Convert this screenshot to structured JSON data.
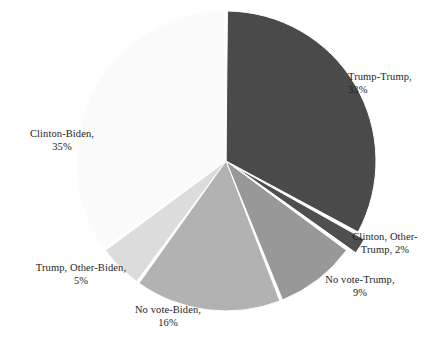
{
  "chart_data": {
    "type": "pie",
    "title": "",
    "subtitle": "",
    "legend_position": "labels-outside",
    "grid": false,
    "start_angle_deg": 0,
    "direction": "clockwise",
    "units": "percent",
    "categories": [
      "Trump-Trump",
      "Clinton, Other-Trump",
      "No vote-Trump",
      "No vote-Biden",
      "Trump, Other-Biden",
      "Clinton-Biden"
    ],
    "values": [
      33,
      2,
      9,
      16,
      5,
      35
    ],
    "slices": [
      {
        "name": "Trump-Trump",
        "label_line1": "Trump-Trump,",
        "label_line2": "33%",
        "value": 33,
        "value_text": "33%",
        "color": "#4a4a4a",
        "exploded": false
      },
      {
        "name": "Clinton, Other-Trump",
        "label_line1": "Clinton, Other-",
        "label_line2": "Trump, 2%",
        "value": 2,
        "value_text": "2%",
        "color": "#4f4f4f",
        "exploded": true
      },
      {
        "name": "No vote-Trump",
        "label_line1": "No vote-Trump,",
        "label_line2": "9%",
        "value": 9,
        "value_text": "9%",
        "color": "#989898",
        "exploded": false
      },
      {
        "name": "No vote-Biden",
        "label_line1": "No vote-Biden,",
        "label_line2": "16%",
        "value": 16,
        "value_text": "16%",
        "color": "#b2b2b2",
        "exploded": false
      },
      {
        "name": "Trump, Other-Biden",
        "label_line1": "Trump, Other-Biden,",
        "label_line2": "5%",
        "value": 5,
        "value_text": "5%",
        "color": "#dcdcdc",
        "exploded": false
      },
      {
        "name": "Clinton-Biden",
        "label_line1": "Clinton-Biden,",
        "label_line2": "35%",
        "value": 35,
        "value_text": "35%",
        "color": "#fbfbfb",
        "exploded": false
      }
    ],
    "colors": {
      "background": "#ffffff",
      "slice_separator": "#ffffff",
      "label_text": "#1d1d1d"
    }
  }
}
